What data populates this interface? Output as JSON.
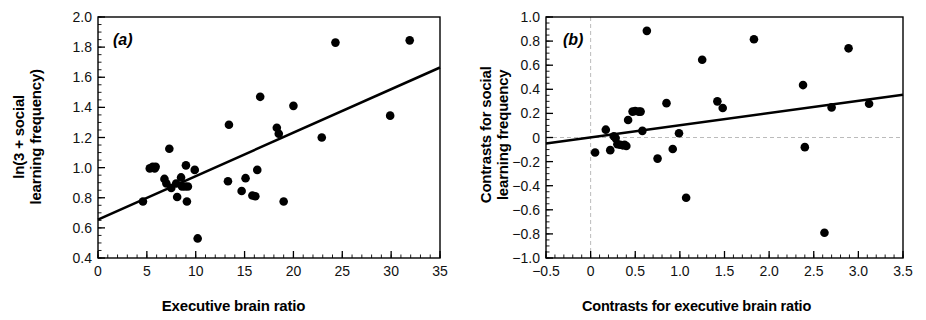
{
  "figure": {
    "background": "#ffffff",
    "ink": "#000000",
    "dash_color": "#bbbbbb"
  },
  "chart_data": [
    {
      "type": "scatter",
      "panel": "a",
      "panel_label": "(a)",
      "title": "",
      "xlabel": "Executive brain ratio",
      "ylabel": "ln(3 + social learning frequency)",
      "ylabel_lines": [
        "ln(3 + social",
        "learning frequency)"
      ],
      "xlim": [
        0,
        35
      ],
      "ylim": [
        0.4,
        2.0
      ],
      "xticks": [
        0,
        5,
        10,
        15,
        20,
        25,
        30,
        35
      ],
      "xticklabels": [
        "0",
        "5",
        "10",
        "15",
        "20",
        "25",
        "30",
        "35"
      ],
      "yticks": [
        0.4,
        0.6,
        0.8,
        1.0,
        1.2,
        1.4,
        1.6,
        1.8,
        2.0
      ],
      "yticklabels": [
        "0.4",
        "0.6",
        "0.8",
        "1.0",
        "1.2",
        "1.4",
        "1.6",
        "1.8",
        "2.0"
      ],
      "x_minor_step": 1,
      "y_minor_step": 0.05,
      "grid": false,
      "legend": "none",
      "marker": "filled-circle",
      "marker_size": 7,
      "points": [
        [
          4.6,
          0.775
        ],
        [
          5.3,
          0.995
        ],
        [
          5.6,
          1.005
        ],
        [
          5.8,
          0.995
        ],
        [
          5.9,
          1.005
        ],
        [
          6.8,
          0.925
        ],
        [
          7.0,
          0.895
        ],
        [
          7.3,
          1.125
        ],
        [
          7.5,
          0.865
        ],
        [
          8.0,
          0.895
        ],
        [
          8.1,
          0.805
        ],
        [
          8.5,
          0.935
        ],
        [
          8.6,
          0.875
        ],
        [
          8.9,
          0.875
        ],
        [
          9.0,
          1.015
        ],
        [
          9.1,
          0.775
        ],
        [
          9.2,
          0.875
        ],
        [
          9.9,
          0.985
        ],
        [
          10.2,
          0.53
        ],
        [
          13.3,
          0.91
        ],
        [
          13.4,
          1.285
        ],
        [
          14.7,
          0.845
        ],
        [
          15.1,
          0.93
        ],
        [
          15.8,
          0.815
        ],
        [
          16.1,
          0.81
        ],
        [
          16.3,
          0.985
        ],
        [
          16.6,
          1.47
        ],
        [
          18.3,
          1.265
        ],
        [
          18.5,
          1.225
        ],
        [
          19.0,
          0.775
        ],
        [
          20.0,
          1.41
        ],
        [
          22.9,
          1.2
        ],
        [
          24.3,
          1.83
        ],
        [
          29.9,
          1.345
        ],
        [
          31.9,
          1.845
        ]
      ],
      "fit_line": {
        "type": "linear-regression",
        "x_start": 0,
        "y_start": 0.655,
        "x_end": 35,
        "y_end": 1.665
      }
    },
    {
      "type": "scatter",
      "panel": "b",
      "panel_label": "(b)",
      "title": "",
      "xlabel": "Contrasts for executive brain ratio",
      "ylabel": "Contrasts for social learning frequency",
      "ylabel_lines": [
        "Contrasts for social",
        "learning frequency"
      ],
      "xlim": [
        -0.5,
        3.5
      ],
      "ylim": [
        -1.0,
        1.0
      ],
      "xticks": [
        -0.5,
        0,
        0.5,
        1.0,
        1.5,
        2.0,
        2.5,
        3.0,
        3.5
      ],
      "xticklabels": [
        "−0.5",
        "0",
        "0.5",
        "1.0",
        "1.5",
        "2.0",
        "2.5",
        "3.0",
        "3.5"
      ],
      "yticks": [
        -1.0,
        -0.8,
        -0.6,
        -0.4,
        -0.2,
        0,
        0.2,
        0.4,
        0.6,
        0.8,
        1.0
      ],
      "yticklabels": [
        "−1.0",
        "−0.8",
        "−0.6",
        "−0.4",
        "−0.2",
        "0",
        "0.2",
        "0.4",
        "0.6",
        "0.8",
        "1.0"
      ],
      "x_minor_step": 0.1,
      "y_minor_step": 0.05,
      "grid": false,
      "legend": "none",
      "marker": "filled-circle",
      "marker_size": 7,
      "reference_lines": [
        {
          "axis": "x",
          "value": 0,
          "style": "dashed"
        },
        {
          "axis": "y",
          "value": 0,
          "style": "dashed"
        }
      ],
      "points": [
        [
          0.05,
          -0.125
        ],
        [
          0.17,
          0.065
        ],
        [
          0.22,
          -0.105
        ],
        [
          0.26,
          0.01
        ],
        [
          0.28,
          -0.005
        ],
        [
          0.3,
          -0.055
        ],
        [
          0.33,
          -0.06
        ],
        [
          0.36,
          -0.065
        ],
        [
          0.38,
          -0.06
        ],
        [
          0.4,
          -0.07
        ],
        [
          0.42,
          0.145
        ],
        [
          0.47,
          0.215
        ],
        [
          0.5,
          0.22
        ],
        [
          0.54,
          0.215
        ],
        [
          0.56,
          0.215
        ],
        [
          0.58,
          0.055
        ],
        [
          0.63,
          0.885
        ],
        [
          0.75,
          -0.175
        ],
        [
          0.85,
          0.285
        ],
        [
          0.92,
          -0.095
        ],
        [
          0.99,
          0.035
        ],
        [
          1.07,
          -0.5
        ],
        [
          1.25,
          0.645
        ],
        [
          1.42,
          0.3
        ],
        [
          1.48,
          0.245
        ],
        [
          1.83,
          0.815
        ],
        [
          2.38,
          0.435
        ],
        [
          2.4,
          -0.08
        ],
        [
          2.62,
          -0.79
        ],
        [
          2.7,
          0.25
        ],
        [
          2.89,
          0.74
        ],
        [
          3.12,
          0.28
        ]
      ],
      "fit_line": {
        "type": "linear-regression",
        "x_start": -0.5,
        "y_start": -0.05,
        "x_end": 3.5,
        "y_end": 0.355
      }
    }
  ]
}
